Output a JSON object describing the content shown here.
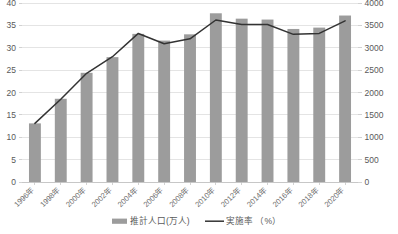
{
  "chart_data": {
    "type": "bar",
    "title": "",
    "subtitle": "",
    "xlabel": "",
    "ylabel": "",
    "grid": true,
    "legend_position": "bottom",
    "categories": [
      "1996年",
      "1998年",
      "2000年",
      "2002年",
      "2004年",
      "2006年",
      "2008年",
      "2010年",
      "2012年",
      "2014年",
      "2016年",
      "2018年",
      "2020年"
    ],
    "series": [
      {
        "name": "推計人口(万人)",
        "type": "bar",
        "axis": "right",
        "color": "#9c9c9c",
        "values": [
          1310,
          1860,
          2440,
          2790,
          3310,
          3160,
          3300,
          3770,
          3650,
          3630,
          3420,
          3450,
          3720
        ]
      },
      {
        "name": "実施率 （%）",
        "type": "line",
        "axis": "left",
        "color": "#333333",
        "values": [
          13.1,
          18.5,
          24.3,
          28.0,
          33.2,
          30.9,
          32.0,
          36.2,
          35.2,
          35.2,
          33.0,
          33.2,
          36.0
        ]
      }
    ],
    "axes": {
      "left": {
        "name": "実施率 （%）",
        "min": 0,
        "max": 40,
        "step": 5,
        "ticks": [
          "0",
          "5",
          "10",
          "15",
          "20",
          "25",
          "30",
          "35",
          "40"
        ]
      },
      "right": {
        "name": "推計人口(万人)",
        "min": 0,
        "max": 4000,
        "step": 500,
        "ticks": [
          "0",
          "500",
          "1000",
          "1500",
          "2000",
          "2500",
          "3000",
          "3500",
          "4000"
        ]
      }
    }
  },
  "legend": {
    "items": [
      {
        "label": "推計人口(万人)",
        "marker": "bar-swatch",
        "color": "#9c9c9c"
      },
      {
        "label": "実施率 （%）",
        "marker": "line-swatch",
        "color": "#333333"
      }
    ]
  },
  "colors": {
    "bar": "#9c9c9c",
    "line": "#333333",
    "grid": "#d9d9d9",
    "axis_text": "#595959",
    "background": "#ffffff"
  }
}
